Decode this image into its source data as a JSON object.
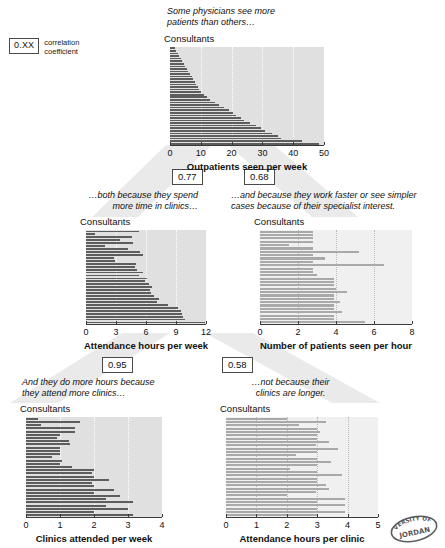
{
  "legend": {
    "value": "0.XX",
    "caption_line1": "correlation",
    "caption_line2": "coefficient"
  },
  "watermark": {
    "text_outer": "VERSITY OF",
    "text_inner": "JORDAN"
  },
  "captions": {
    "top": "Some physicians see more\npatients than others…",
    "mid_left": "…both because they spend\nmore time in clinics…",
    "mid_right": "…and because they work faster or see simpler\ncases because of their specialist interest.",
    "bottom_left": "And they do more hours because\nthey attend more clinics…",
    "bottom_right": "…not because their\nclinics are longer."
  },
  "correlations": {
    "c_077": "0.77",
    "c_068": "0.68",
    "c_095": "0.95",
    "c_058": "0.58"
  },
  "chart_data": [
    {
      "id": "outpatients",
      "type": "bar",
      "orientation": "horizontal",
      "title": "Some physicians see more patients than others…",
      "ylabel": "Consultants",
      "xlabel": "Outpatients seen per week",
      "xlim": [
        0,
        50
      ],
      "xticks": [
        0,
        10,
        20,
        30,
        40,
        50
      ],
      "ticklabels": [
        "0",
        "10",
        "20",
        "30",
        "40",
        "50"
      ],
      "grid": true,
      "gridlines": [
        10,
        20,
        30,
        40,
        50
      ],
      "bar_color": "#5d5d5d",
      "plot_bg": "#e0e0e0",
      "values": [
        1.5,
        2.0,
        2.5,
        3.0,
        3.5,
        4.0,
        4.5,
        5.0,
        5.5,
        6.0,
        6.5,
        7.0,
        7.5,
        8.0,
        8.5,
        9.0,
        9.5,
        10.0,
        11.0,
        12.0,
        13.0,
        14.5,
        16.0,
        17.5,
        19.0,
        20.5,
        21.5,
        23.0,
        24.0,
        26.0,
        28.0,
        29.5,
        31.0,
        33.0,
        35.0,
        36.0,
        43.0,
        48.5
      ]
    },
    {
      "id": "attendance-hours-week",
      "type": "bar",
      "orientation": "horizontal",
      "title": "…both because they spend more time in clinics…",
      "ylabel": "Consultants",
      "xlabel": "Attendance hours per week",
      "xlim": [
        0,
        12
      ],
      "xticks": [
        0,
        3,
        6,
        9,
        12
      ],
      "ticklabels": [
        "0",
        "3",
        "6",
        "9",
        "12"
      ],
      "grid": true,
      "gridlines": [
        3,
        6,
        9,
        12
      ],
      "bar_color": "#5d5d5d",
      "plot_bg": "#e0e0e0",
      "values": [
        5.3,
        0.9,
        4.6,
        3.4,
        4.7,
        1.9,
        4.2,
        5.4,
        5.7,
        2.8,
        2.9,
        5.0,
        4.9,
        5.1,
        5.7,
        5.3,
        6.1,
        5.9,
        6.3,
        6.6,
        6.4,
        6.5,
        6.8,
        7.3,
        7.1,
        8.2,
        9.2,
        9.5,
        9.6,
        9.7,
        9.9,
        11.9
      ]
    },
    {
      "id": "patients-per-hour",
      "type": "bar",
      "orientation": "horizontal",
      "title": "…and because they work faster or see simpler cases because of their specialist interest.",
      "ylabel": "Consultants",
      "xlabel": "Number of patients seen per hour",
      "xlim": [
        0,
        8
      ],
      "xticks": [
        0,
        2,
        4,
        6,
        8
      ],
      "ticklabels": [
        "0",
        "2",
        "4",
        "6",
        "8"
      ],
      "grid": true,
      "gridlines": [
        2,
        4,
        6,
        8
      ],
      "bar_color": "#a9a9a9",
      "plot_bg": "#f0f0f0",
      "values": [
        2.8,
        2.8,
        2.8,
        2.8,
        1.5,
        2.8,
        5.2,
        2.8,
        3.4,
        2.8,
        6.5,
        2.8,
        2.8,
        3.0,
        3.9,
        3.9,
        3.9,
        4.0,
        4.6,
        3.9,
        3.9,
        4.2,
        3.9,
        3.9,
        4.3,
        3.9,
        3.9,
        5.5
      ]
    },
    {
      "id": "clinics-per-week",
      "type": "bar",
      "orientation": "horizontal",
      "title": "And they do more hours because they attend more clinics…",
      "ylabel": "Consultants",
      "xlabel": "Clinics attended per week",
      "xlim": [
        0,
        4
      ],
      "xticks": [
        0,
        1,
        2,
        3,
        4
      ],
      "ticklabels": [
        "0",
        "1",
        "2",
        "3",
        "4"
      ],
      "grid": true,
      "gridlines": [
        1,
        2,
        3,
        4
      ],
      "bar_color": "#5d5d5d",
      "plot_bg": "#e0e0e0",
      "values": [
        0.35,
        1.6,
        0.45,
        1.45,
        1.45,
        1.0,
        0.9,
        1.25,
        1.3,
        1.0,
        1.0,
        1.0,
        0.75,
        1.05,
        1.0,
        1.35,
        2.0,
        1.95,
        2.0,
        2.45,
        1.95,
        2.0,
        2.6,
        2.0,
        2.75,
        2.35,
        3.15,
        2.35,
        3.0,
        2.0,
        3.15
      ]
    },
    {
      "id": "attendance-hours-clinic",
      "type": "bar",
      "orientation": "horizontal",
      "title": "…not because their clinics are longer.",
      "ylabel": "Consultants",
      "xlabel": "Attendance hours per clinic",
      "xlim": [
        0,
        5
      ],
      "xticks": [
        0,
        1,
        2,
        3,
        4,
        5
      ],
      "ticklabels": [
        "0",
        "1",
        "2",
        "3",
        "4",
        "5"
      ],
      "grid": true,
      "gridlines": [
        1,
        2,
        3,
        4,
        5
      ],
      "bar_color": "#a9a9a9",
      "plot_bg": "#f0f0f0",
      "values": [
        2.0,
        3.3,
        2.4,
        3.0,
        3.1,
        3.0,
        3.0,
        3.4,
        2.95,
        3.7,
        3.0,
        2.3,
        3.0,
        3.45,
        3.0,
        2.1,
        3.0,
        3.8,
        3.0,
        3.0,
        3.3,
        3.4,
        2.95,
        2.0,
        3.9,
        3.0,
        3.9,
        3.0,
        3.9,
        3.0
      ]
    }
  ]
}
